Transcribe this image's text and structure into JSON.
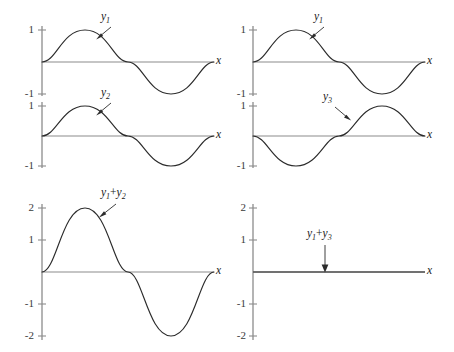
{
  "figure": {
    "background": "#ffffff",
    "curve_color": "#2b2b2b",
    "axis_color": "#8c8c8c",
    "width": 454,
    "height": 352
  },
  "panels": [
    {
      "id": "panel-y1-top-left",
      "curve_label": "y1",
      "curve_label_base": "y",
      "curve_label_sub": "1",
      "x_axis_label": "x",
      "y_ticks": [
        "1",
        "-1"
      ],
      "y_tick_values": [
        1,
        -1
      ],
      "amplitude": 1,
      "phase_deg": 0,
      "cycles": 1,
      "description": "y1 = sin(x), one full cycle, amplitude 1"
    },
    {
      "id": "panel-y2-mid-left",
      "curve_label": "y2",
      "curve_label_base": "y",
      "curve_label_sub": "2",
      "x_axis_label": "x",
      "y_ticks": [
        "1",
        "-1"
      ],
      "y_tick_values": [
        1,
        -1
      ],
      "amplitude": 1,
      "phase_deg": 0,
      "cycles": 1,
      "description": "y2 = sin(x), in phase with y1, amplitude 1"
    },
    {
      "id": "panel-y1-top-right",
      "curve_label": "y1",
      "curve_label_base": "y",
      "curve_label_sub": "1",
      "x_axis_label": "x",
      "y_ticks": [
        "1",
        "-1"
      ],
      "y_tick_values": [
        1,
        -1
      ],
      "amplitude": 1,
      "phase_deg": 0,
      "cycles": 1,
      "description": "y1 = sin(x), one full cycle, amplitude 1"
    },
    {
      "id": "panel-y3-mid-right",
      "curve_label": "y3",
      "curve_label_base": "y",
      "curve_label_sub": "3",
      "x_axis_label": "x",
      "y_ticks": [
        "1",
        "-1"
      ],
      "y_tick_values": [
        1,
        -1
      ],
      "amplitude": 1,
      "phase_deg": 180,
      "cycles": 1,
      "description": "y3 = -sin(x), 180 degrees out of phase with y1, amplitude 1"
    },
    {
      "id": "panel-sum-y1-y2",
      "curve_label": "y1 + y2",
      "curve_label_base": "y",
      "curve_label_sub": "1",
      "curve_label_op": "+",
      "curve_label_base2": "y",
      "curve_label_sub2": "2",
      "x_axis_label": "x",
      "y_ticks": [
        "2",
        "1",
        "-1",
        "-2"
      ],
      "y_tick_values": [
        2,
        1,
        -1,
        -2
      ],
      "amplitude": 2,
      "phase_deg": 0,
      "cycles": 1,
      "description": "Constructive interference: y1 + y2 = 2 sin(x), amplitude 2"
    },
    {
      "id": "panel-sum-y1-y3",
      "curve_label": "y1 + y3",
      "curve_label_base": "y",
      "curve_label_sub": "1",
      "curve_label_op": "+",
      "curve_label_base2": "y",
      "curve_label_sub2": "3",
      "x_axis_label": "x",
      "y_ticks": [
        "2",
        "1",
        "-1",
        "-2"
      ],
      "y_tick_values": [
        2,
        1,
        -1,
        -2
      ],
      "amplitude": 0,
      "phase_deg": 0,
      "cycles": 1,
      "description": "Destructive interference: y1 + y3 = 0, flat line on the x axis"
    }
  ],
  "labels": {
    "y": "y",
    "x": "x",
    "plus": "+",
    "one": "1",
    "minus_one": "-1",
    "two": "2",
    "minus_two": "-2",
    "sub1": "1",
    "sub2": "2",
    "sub3": "3"
  }
}
